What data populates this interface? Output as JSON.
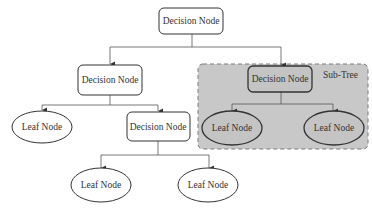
{
  "diagram": {
    "type": "decision-tree",
    "colors": {
      "background": "#ffffff",
      "subtree_fill": "#c8c8c8",
      "subtree_border": "#808080",
      "node_stroke": "#333333",
      "edge": "#555555"
    },
    "subtree": {
      "label": "Sub-Tree"
    },
    "nodes": {
      "root": {
        "label": "Decision Node",
        "kind": "decision"
      },
      "left_decision": {
        "label": "Decision Node",
        "kind": "decision"
      },
      "right_decision": {
        "label": "Decision Node",
        "kind": "decision"
      },
      "leaf_left": {
        "label": "Leaf Node",
        "kind": "leaf"
      },
      "inner_decision": {
        "label": "Decision Node",
        "kind": "decision"
      },
      "subtree_leaf_left": {
        "label": "Leaf Node",
        "kind": "leaf"
      },
      "subtree_leaf_right": {
        "label": "Leaf Node",
        "kind": "leaf"
      },
      "bottom_leaf_left": {
        "label": "Leaf Node",
        "kind": "leaf"
      },
      "bottom_leaf_right": {
        "label": "Leaf Node",
        "kind": "leaf"
      }
    },
    "edges": [
      [
        "root",
        "left_decision"
      ],
      [
        "root",
        "right_decision"
      ],
      [
        "left_decision",
        "leaf_left"
      ],
      [
        "left_decision",
        "inner_decision"
      ],
      [
        "right_decision",
        "subtree_leaf_left"
      ],
      [
        "right_decision",
        "subtree_leaf_right"
      ],
      [
        "inner_decision",
        "bottom_leaf_left"
      ],
      [
        "inner_decision",
        "bottom_leaf_right"
      ]
    ]
  }
}
